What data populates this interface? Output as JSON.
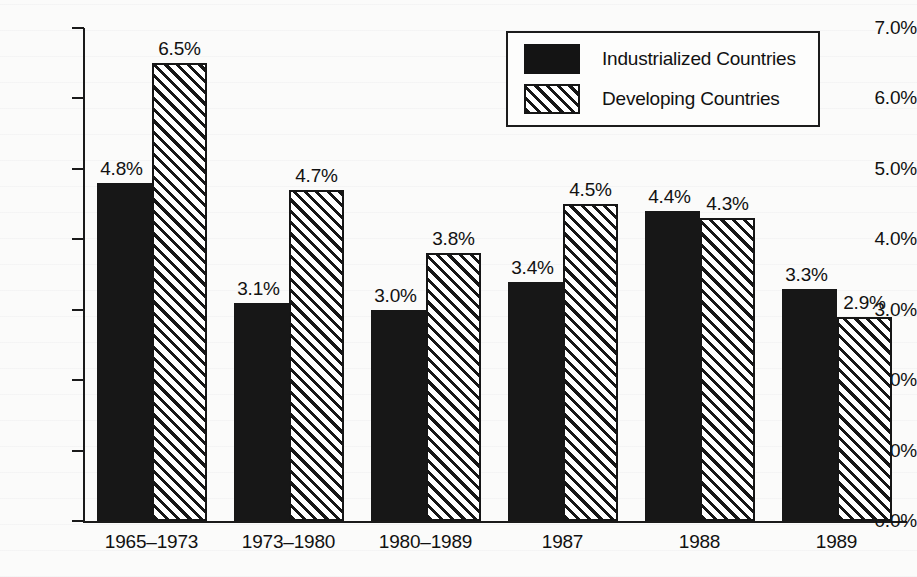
{
  "chart_data": {
    "type": "bar",
    "title": "",
    "subtitle": "",
    "xlabel": "",
    "ylabel": "",
    "categories": [
      "1965–1973",
      "1973–1980",
      "1980–1989",
      "1987",
      "1988",
      "1989"
    ],
    "series": [
      {
        "name": "Industrialized Countries",
        "fill": "solid-black",
        "values": [
          4.8,
          3.1,
          3.0,
          3.4,
          4.4,
          3.3
        ],
        "value_labels": [
          "4.8%",
          "3.1%",
          "3.0%",
          "3.4%",
          "4.4%",
          "3.3%"
        ]
      },
      {
        "name": "Developing Countries",
        "fill": "diagonal-hatch",
        "values": [
          6.5,
          4.7,
          3.8,
          4.5,
          4.3,
          2.9
        ],
        "value_labels": [
          "6.5%",
          "4.7%",
          "3.8%",
          "4.5%",
          "4.3%",
          "2.9%"
        ]
      }
    ],
    "ylim": [
      0.0,
      7.0
    ],
    "ytick_values": [
      7.0,
      6.0,
      5.0,
      4.0,
      3.0,
      2.0,
      1.0,
      0.0
    ],
    "ytick_labels": [
      "7.0%",
      "6.0%",
      "5.0%",
      "4.0%",
      "3.0%",
      "2.0%",
      "1.0%",
      "0.0%"
    ],
    "grid": false,
    "legend_position": "top-right",
    "colors": {
      "ink": "#141414",
      "background": "#fbfbfa",
      "series_1": "#141414",
      "series_2": "#ffffff"
    }
  },
  "legend": {
    "items": [
      {
        "label": "Industrialized Countries",
        "swatch": "solid"
      },
      {
        "label": "Developing Countries",
        "swatch": "hatch"
      }
    ]
  },
  "axis": {
    "y_labels": [
      "7.0%",
      "6.0%",
      "5.0%",
      "4.0%",
      "3.0%",
      "2.0%",
      "1.0%",
      "0.0%"
    ],
    "x_labels": [
      "1965–1973",
      "1973–1980",
      "1980–1989",
      "1987",
      "1988",
      "1989"
    ]
  },
  "values": {
    "g0s0": "4.8%",
    "g0s1": "6.5%",
    "g1s0": "3.1%",
    "g1s1": "4.7%",
    "g2s0": "3.0%",
    "g2s1": "3.8%",
    "g3s0": "3.4%",
    "g3s1": "4.5%",
    "g4s0": "4.4%",
    "g4s1": "4.3%",
    "g5s0": "3.3%",
    "g5s1": "2.9%"
  }
}
